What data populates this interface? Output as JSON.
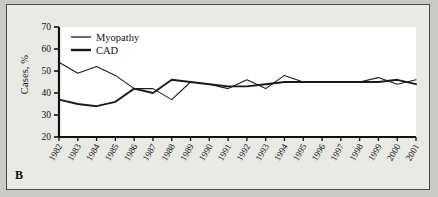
{
  "figure": {
    "panel_label": "B",
    "background_color": "#e9e9e6",
    "plot_background_color": "#ffffff",
    "axis_color": "#111111"
  },
  "chart_data": {
    "type": "line",
    "title": "",
    "xlabel": "",
    "ylabel": "Cases, %",
    "ylim": [
      20,
      70
    ],
    "yticks": [
      20,
      30,
      40,
      50,
      60,
      70
    ],
    "grid": false,
    "legend_position": "top-left",
    "x": [
      1982,
      1983,
      1984,
      1985,
      1986,
      1987,
      1988,
      1989,
      1990,
      1991,
      1992,
      1993,
      1994,
      1995,
      1996,
      1997,
      1998,
      1999,
      2000,
      2001
    ],
    "categories": [
      "1982",
      "1983",
      "1984",
      "1985",
      "1986",
      "1987",
      "1988",
      "1989",
      "1990",
      "1991",
      "1992",
      "1993",
      "1994",
      "1995",
      "1996",
      "1997",
      "1998",
      "1999",
      "2000",
      "2001"
    ],
    "series": [
      {
        "name": "Myopathy",
        "line_style": "thin",
        "color": "#1a1a1a",
        "values": [
          54,
          49,
          52,
          48,
          42,
          42,
          37,
          45,
          44,
          42,
          46,
          42,
          48,
          45,
          45,
          45,
          45,
          47,
          44,
          46
        ]
      },
      {
        "name": "CAD",
        "line_style": "thick",
        "color": "#1a1a1a",
        "values": [
          37,
          35,
          34,
          36,
          42,
          40,
          46,
          45,
          44,
          43,
          43,
          44,
          45,
          45,
          45,
          45,
          45,
          45,
          46,
          44
        ]
      }
    ]
  }
}
